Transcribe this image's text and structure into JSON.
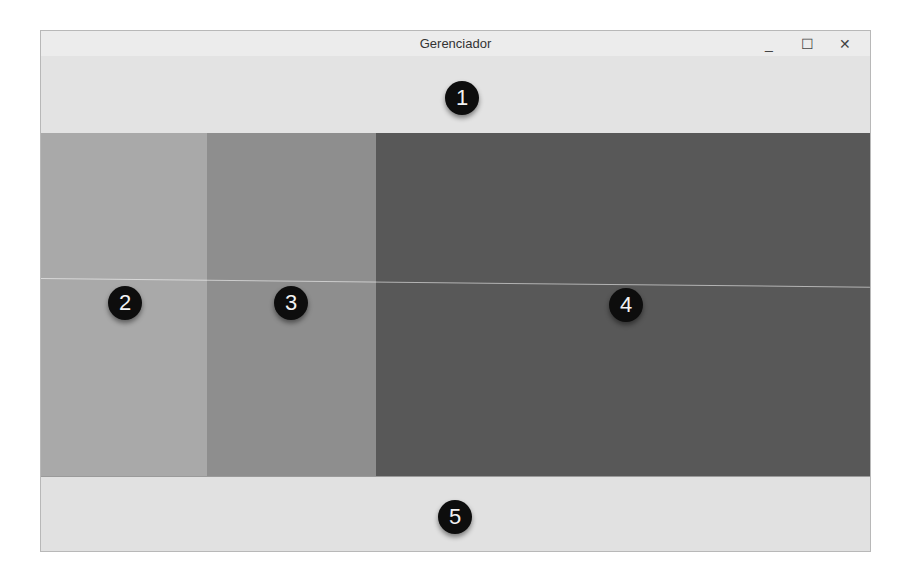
{
  "window": {
    "title": "Gerenciador",
    "controls": {
      "minimize": "_",
      "maximize": "☐",
      "close": "✕"
    }
  },
  "regions": [
    {
      "id": 1,
      "label": "1",
      "color": "#e3e3e3"
    },
    {
      "id": 2,
      "label": "2",
      "color": "#a9a9a9"
    },
    {
      "id": 3,
      "label": "3",
      "color": "#8e8e8e"
    },
    {
      "id": 4,
      "label": "4",
      "color": "#585858"
    },
    {
      "id": 5,
      "label": "5",
      "color": "#e1e1e1"
    }
  ]
}
